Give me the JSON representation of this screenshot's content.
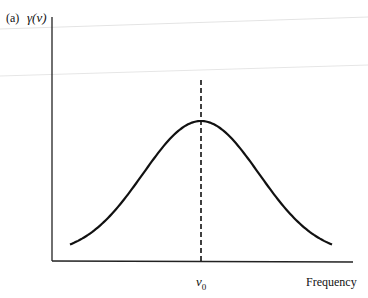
{
  "chart_data": {
    "type": "line",
    "title": "",
    "panel_label": "(a)",
    "xlabel": "Frequency",
    "ylabel": "γ(ν)",
    "x_tick_labels": [
      {
        "position": "center",
        "label": "ν0"
      }
    ],
    "y_tick_labels": [],
    "grid": false,
    "legend": null,
    "series": [
      {
        "name": "line shape γ(ν)",
        "shape": "gaussian",
        "center_label": "ν0",
        "x": [
          -3,
          -2.5,
          -2,
          -1.5,
          -1,
          -0.5,
          0,
          0.5,
          1,
          1.5,
          2,
          2.5,
          3
        ],
        "values": [
          0.03,
          0.08,
          0.17,
          0.33,
          0.56,
          0.82,
          1.0,
          0.82,
          0.56,
          0.33,
          0.17,
          0.08,
          0.03
        ]
      }
    ],
    "annotations": [
      {
        "type": "vertical-dashed-line",
        "at": "ν0",
        "description": "dashed line marking line center"
      }
    ],
    "xlim": [
      -3.4,
      3.6
    ],
    "ylim": [
      0,
      1.4
    ]
  },
  "labels": {
    "panel": "(a)",
    "y_axis": "γ(ν)",
    "x_tick_main": "ν",
    "x_tick_sub": "0",
    "x_axis": "Frequency"
  }
}
